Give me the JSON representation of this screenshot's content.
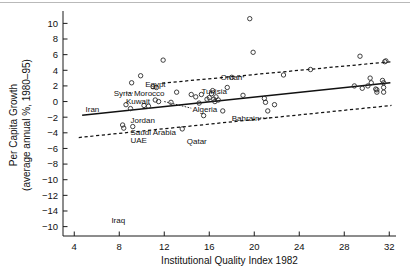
{
  "chart_data": {
    "type": "scatter",
    "title": "",
    "xlabel": "Institutional Quality Index 1982",
    "ylabel_line1": "Per Capita Growth",
    "ylabel_line2": "(average annual %, 1980–95)",
    "xlim": [
      3.0,
      32.6
    ],
    "ylim": [
      -17.2,
      11.2
    ],
    "xticks": [
      4,
      8,
      12,
      16,
      20,
      24,
      28,
      32
    ],
    "xticklabels": [
      "4",
      "8",
      "12",
      "16",
      "20",
      "24",
      "28",
      "32"
    ],
    "yticks": [
      10,
      8,
      6,
      4,
      2,
      0,
      -2,
      -4,
      -6,
      -8,
      -10,
      -12,
      -14,
      -16
    ],
    "yticklabels": [
      "10",
      "8",
      "6",
      "4",
      "2",
      "0",
      "−2",
      "−4",
      "−6",
      "−8",
      "−10",
      "−12",
      "−14",
      "−10"
    ],
    "grid": false,
    "legend": null,
    "points": [
      {
        "x": 8.3,
        "y": -3.0
      },
      {
        "x": 8.4,
        "y": -3.4
      },
      {
        "x": 8.6,
        "y": -0.4
      },
      {
        "x": 9.0,
        "y": -0.9
      },
      {
        "x": 9.1,
        "y": 2.4
      },
      {
        "x": 9.2,
        "y": -3.2
      },
      {
        "x": 9.9,
        "y": 3.3
      },
      {
        "x": 10.2,
        "y": -0.5
      },
      {
        "x": 10.6,
        "y": -0.6
      },
      {
        "x": 11.0,
        "y": 1.9
      },
      {
        "x": 11.2,
        "y": 0.2
      },
      {
        "x": 11.3,
        "y": 1.8
      },
      {
        "x": 11.5,
        "y": 0.0
      },
      {
        "x": 11.9,
        "y": 5.3
      },
      {
        "x": 12.6,
        "y": -0.1
      },
      {
        "x": 13.1,
        "y": 1.2
      },
      {
        "x": 13.6,
        "y": -3.5
      },
      {
        "x": 14.4,
        "y": 0.9
      },
      {
        "x": 14.8,
        "y": 0.6
      },
      {
        "x": 15.1,
        "y": -0.2
      },
      {
        "x": 15.3,
        "y": 0.9
      },
      {
        "x": 15.5,
        "y": -1.8
      },
      {
        "x": 15.8,
        "y": 0.3
      },
      {
        "x": 16.0,
        "y": 0.5
      },
      {
        "x": 16.2,
        "y": 1.0
      },
      {
        "x": 16.3,
        "y": 1.4
      },
      {
        "x": 16.4,
        "y": 0.3
      },
      {
        "x": 16.5,
        "y": 0.0
      },
      {
        "x": 16.6,
        "y": 0.6
      },
      {
        "x": 16.8,
        "y": 0.2
      },
      {
        "x": 17.2,
        "y": -1.2
      },
      {
        "x": 17.6,
        "y": 1.8
      },
      {
        "x": 18.0,
        "y": 3.1
      },
      {
        "x": 19.0,
        "y": 0.8
      },
      {
        "x": 19.6,
        "y": 10.6
      },
      {
        "x": 19.9,
        "y": 6.3
      },
      {
        "x": 20.9,
        "y": 0.4
      },
      {
        "x": 21.0,
        "y": -0.1
      },
      {
        "x": 21.2,
        "y": -1.2
      },
      {
        "x": 21.8,
        "y": -0.4
      },
      {
        "x": 22.6,
        "y": 3.4
      },
      {
        "x": 25.0,
        "y": 4.1
      },
      {
        "x": 28.9,
        "y": 2.0
      },
      {
        "x": 29.4,
        "y": 5.8
      },
      {
        "x": 29.6,
        "y": 1.7
      },
      {
        "x": 30.1,
        "y": 2.0
      },
      {
        "x": 30.3,
        "y": 3.0
      },
      {
        "x": 30.4,
        "y": 2.4
      },
      {
        "x": 30.8,
        "y": 1.6
      },
      {
        "x": 30.9,
        "y": 1.2
      },
      {
        "x": 30.9,
        "y": 1.5
      },
      {
        "x": 31.4,
        "y": 2.7
      },
      {
        "x": 31.5,
        "y": 2.4
      },
      {
        "x": 31.5,
        "y": 1.8
      },
      {
        "x": 31.5,
        "y": 1.2
      },
      {
        "x": 31.6,
        "y": 5.1
      },
      {
        "x": 31.7,
        "y": 5.2
      }
    ],
    "fit_line": {
      "x0": 4.7,
      "y0": -1.75,
      "x1": 32.1,
      "y1": 2.4
    },
    "upper_band": {
      "x0": 11.8,
      "y0": 2.35,
      "x1": 32.2,
      "y1": 5.1
    },
    "lower_band": {
      "x0": 4.4,
      "y0": -4.6,
      "x1": 32.2,
      "y1": -0.5
    },
    "annotations": [
      {
        "label": "Iran",
        "x": 5.0,
        "y": -1.0,
        "anchor": "start"
      },
      {
        "label": "Syria",
        "x": 7.5,
        "y": 1.1,
        "anchor": "start"
      },
      {
        "label": "Morocco",
        "x": 9.3,
        "y": 1.1,
        "anchor": "start"
      },
      {
        "label": "Kuwait",
        "x": 8.6,
        "y": 0.1,
        "anchor": "start"
      },
      {
        "label": "Egypt",
        "x": 10.3,
        "y": 2.3,
        "anchor": "start"
      },
      {
        "label": "Jordan",
        "x": 9.0,
        "y": -2.4,
        "anchor": "start"
      },
      {
        "label": "Saudi Arabia",
        "x": 9.0,
        "y": -3.9,
        "anchor": "start"
      },
      {
        "label": "UAE",
        "x": 9.0,
        "y": -4.9,
        "anchor": "start"
      },
      {
        "label": "Algeria",
        "x": 14.5,
        "y": -1.0,
        "anchor": "start"
      },
      {
        "label": "Tunisia",
        "x": 15.3,
        "y": 1.3,
        "anchor": "start"
      },
      {
        "label": "Qatar",
        "x": 14.0,
        "y": -5.0,
        "anchor": "start"
      },
      {
        "label": "Oman",
        "x": 17.0,
        "y": 3.2,
        "anchor": "start"
      },
      {
        "label": "Bahrain",
        "x": 18.0,
        "y": -2.1,
        "anchor": "start"
      },
      {
        "label": "Iraq",
        "x": 7.3,
        "y": -15.2,
        "anchor": "start"
      }
    ],
    "leaders": [
      {
        "x0": 8.6,
        "y0": 1.1,
        "x1": 9.2,
        "y1": 1.1
      },
      {
        "x0": 12.0,
        "y0": 0.0,
        "x1": 14.4,
        "y1": -0.85
      },
      {
        "x0": 18.7,
        "y0": 3.2,
        "x1": 19.2,
        "y1": 3.15
      },
      {
        "x0": 20.5,
        "y0": -2.1,
        "x1": 21.5,
        "y1": -2.1
      }
    ]
  },
  "axes": {
    "x_title": "Institutional Quality Index 1982",
    "y_title_line1": "Per Capita Growth",
    "y_title_line2": "(average annual %, 1980−95)"
  },
  "colors": {
    "ink": "#111111",
    "marker_stroke": "#2b2b2b",
    "background": "#ffffff",
    "top_rule": "#b9b9b9"
  }
}
